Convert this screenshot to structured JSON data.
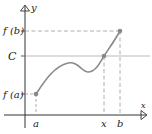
{
  "diagram": {
    "type": "intermediate-value-theorem-graph",
    "axes": {
      "x_label": "x",
      "y_label": "y"
    },
    "labels": {
      "fb": "f (b)",
      "C": "C",
      "fa": "f (a)",
      "a": "a",
      "x": "x",
      "b": "b"
    },
    "colors": {
      "axis": "#333333",
      "curve": "#8a8a8a",
      "point": "#888888",
      "dashed": "#999999",
      "c_line": "#aaaaaa",
      "text": "#222222"
    },
    "points": [
      {
        "name": "point-a",
        "label": "(a, f(a))"
      },
      {
        "name": "point-x",
        "label": "(x, C)"
      },
      {
        "name": "point-b",
        "label": "(b, f(b))"
      }
    ]
  }
}
